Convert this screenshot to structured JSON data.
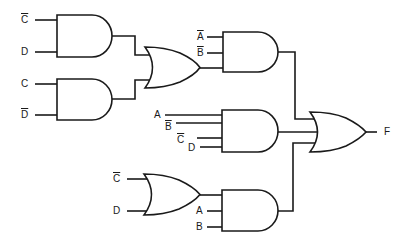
{
  "diagram": {
    "type": "logic-circuit",
    "output_label": "F",
    "gates": [
      {
        "id": "and1",
        "type": "AND",
        "inputs": [
          "C̄",
          "D"
        ]
      },
      {
        "id": "and2",
        "type": "AND",
        "inputs": [
          "C",
          "D̄"
        ]
      },
      {
        "id": "or1",
        "type": "OR",
        "inputs": [
          "and1",
          "and2"
        ]
      },
      {
        "id": "and3",
        "type": "AND",
        "inputs": [
          "Ā",
          "B̄",
          "or1"
        ]
      },
      {
        "id": "and4",
        "type": "AND",
        "inputs": [
          "A",
          "B̄",
          "C̄",
          "D"
        ]
      },
      {
        "id": "or3",
        "type": "OR",
        "inputs": [
          "C̄",
          "D"
        ]
      },
      {
        "id": "and5",
        "type": "AND",
        "inputs": [
          "or3",
          "A",
          "B"
        ]
      },
      {
        "id": "or2",
        "type": "OR",
        "inputs": [
          "and3",
          "and4",
          "and5"
        ],
        "output": "F"
      }
    ],
    "labels": {
      "and1_in1": "C",
      "and1_in2": "D",
      "and2_in1": "C",
      "and2_in2": "D",
      "and3_in1": "A",
      "and3_in2": "B",
      "and4_in1": "A",
      "and4_in2": "B",
      "and4_in3": "C",
      "and4_in4": "D",
      "or3_in1": "C",
      "or3_in2": "D",
      "and5_in2": "A",
      "and5_in3": "B",
      "output": "F"
    }
  }
}
